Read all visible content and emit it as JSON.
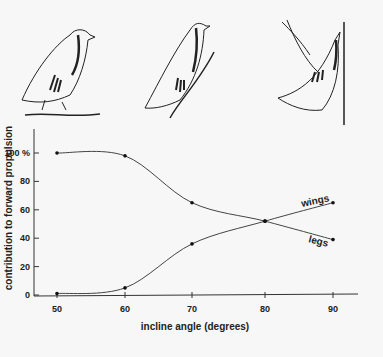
{
  "chart_data": {
    "type": "line",
    "title": "",
    "xlabel": "incline angle (degrees)",
    "ylabel": "contribution to forward propulsion",
    "x": [
      50,
      60,
      70,
      80,
      90
    ],
    "x_ticks": [
      "50",
      "60",
      "70",
      "80",
      "90"
    ],
    "y_ticks": [
      "0",
      "20",
      "40",
      "60",
      "80",
      "100 %"
    ],
    "ylim": [
      0,
      100
    ],
    "grid": false,
    "legend": "inline labels at line ends",
    "series": [
      {
        "name": "legs",
        "values": [
          100,
          98,
          65,
          52,
          39
        ]
      },
      {
        "name": "wings",
        "values": [
          1,
          5,
          36,
          52,
          65
        ]
      }
    ],
    "illustrations": [
      "partridge-standing-flat",
      "partridge-climbing-incline",
      "partridge-flapping-vertical"
    ]
  }
}
